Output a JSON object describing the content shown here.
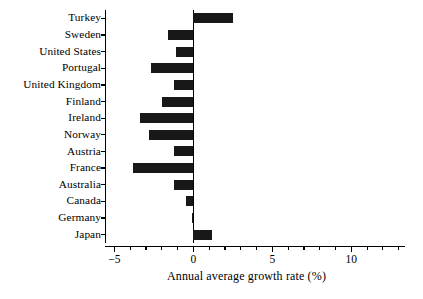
{
  "chart_data": {
    "type": "bar",
    "orientation": "horizontal",
    "title": "",
    "subtitle": "",
    "xlabel": "Annual average growth rate (%)",
    "ylabel": "",
    "xlim": [
      -5.6,
      13.4
    ],
    "xticks": [
      -5,
      0,
      5,
      10
    ],
    "xticklabels": [
      "−5",
      "0",
      "5",
      "10"
    ],
    "minor_tick_step": 1,
    "grid": false,
    "legend": null,
    "bar_color": "#181818",
    "categories": [
      "Turkey",
      "Sweden",
      "United States",
      "Portugal",
      "United Kingdom",
      "Finland",
      "Ireland",
      "Norway",
      "Austria",
      "France",
      "Australia",
      "Canada",
      "Germany",
      "Japan"
    ],
    "values": [
      2.5,
      -1.6,
      -1.1,
      -2.7,
      -1.2,
      -2.0,
      -3.4,
      -2.8,
      -1.2,
      -3.8,
      -1.2,
      -0.5,
      -0.1,
      1.2
    ],
    "series": [
      {
        "name": "Annual average growth rate (%)",
        "values": [
          2.5,
          -1.6,
          -1.1,
          -2.7,
          -1.2,
          -2.0,
          -3.4,
          -2.8,
          -1.2,
          -3.8,
          -1.2,
          -0.5,
          -0.1,
          1.2
        ]
      }
    ]
  }
}
